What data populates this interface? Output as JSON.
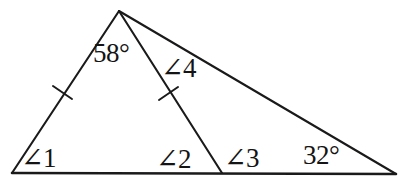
{
  "figure": {
    "kind": "geometry-diagram",
    "background_color": "#ffffff",
    "stroke_color": "#1a1a1a",
    "text_color": "#141414",
    "canvas": {
      "width": 408,
      "height": 186
    },
    "vertices": {
      "apex": {
        "name": "apex-vertex",
        "x": 119,
        "y": 11
      },
      "bottom_left": {
        "name": "bottom-left-vertex",
        "x": 12,
        "y": 173
      },
      "base_middle": {
        "name": "base-middle-vertex",
        "x": 222,
        "y": 173
      },
      "bottom_right": {
        "name": "bottom-right-vertex",
        "x": 396,
        "y": 174
      }
    },
    "segments": [
      {
        "name": "left-side",
        "from": "apex",
        "to": "bottom_left",
        "tick_count": 1
      },
      {
        "name": "cevian",
        "from": "apex",
        "to": "base_middle",
        "tick_count": 1
      },
      {
        "name": "hypotenuse",
        "from": "apex",
        "to": "bottom_right",
        "tick_count": 0
      },
      {
        "name": "base",
        "from": "bottom_left",
        "to": "bottom_right",
        "tick_count": 0
      }
    ],
    "tick_marks": [
      {
        "name": "tick-left-side",
        "x": 62,
        "y": 92,
        "angle_deg": -28
      },
      {
        "name": "tick-cevian",
        "x": 168,
        "y": 93,
        "angle_deg": 28
      }
    ],
    "labels": {
      "angle_58": "58°",
      "angle_4": "∠4",
      "angle_1": "∠1",
      "angle_2": "∠2",
      "angle_3": "∠3",
      "angle_32": "32°"
    }
  }
}
